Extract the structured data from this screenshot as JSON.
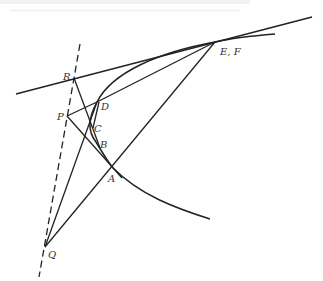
{
  "diagram": {
    "labels": {
      "R": "R",
      "P": "P",
      "D": "D",
      "C": "C",
      "B": "B",
      "A": "A",
      "EF": "E, F",
      "Q": "Q"
    },
    "points": {
      "R": [
        74,
        78
      ],
      "P": [
        67,
        116
      ],
      "D": [
        97,
        102
      ],
      "C": [
        91,
        128
      ],
      "B": [
        96,
        142
      ],
      "A": [
        113,
        168
      ],
      "EF": [
        215,
        42
      ],
      "Q": [
        45,
        247
      ]
    },
    "elements": {
      "tangent_line": "solid line through R and E,F",
      "dashed_line": "dashed line through R, P, Q",
      "curve": "curve through E,F, D, C, B, A",
      "colors": {
        "stroke": "#222222",
        "label": "#333333",
        "background": "#ffffff"
      }
    }
  }
}
